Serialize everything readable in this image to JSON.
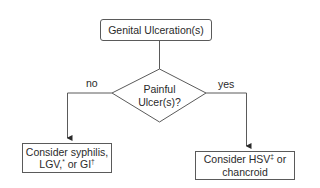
{
  "diagram": {
    "start": {
      "label": "Genital Ulceration(s)"
    },
    "decision": {
      "line1": "Painful",
      "line2": "Ulcer(s)?"
    },
    "branches": {
      "no": {
        "label": "no",
        "line1": "Consider syphilis,",
        "line2_a": "LGV,",
        "line2_sup1": "*",
        "line2_b": " or GI",
        "line2_sup2": "†"
      },
      "yes": {
        "label": "yes",
        "line1_a": "Consider HSV",
        "line1_sup": "‡",
        "line1_b": " or",
        "line2": "chancroid"
      }
    },
    "colors": {
      "stroke": "#5a5a5a",
      "text": "#2a2a2a",
      "background": "#ffffff"
    }
  }
}
